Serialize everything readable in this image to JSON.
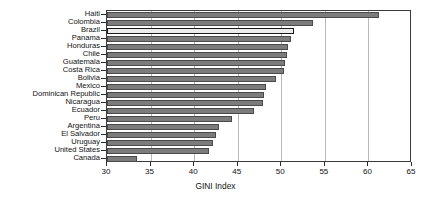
{
  "chart_data": {
    "type": "bar",
    "orientation": "horizontal",
    "title": "",
    "xlabel": "GINI Index",
    "ylabel": "",
    "xlim": [
      30,
      65
    ],
    "xticks": [
      30,
      35,
      40,
      45,
      50,
      55,
      60,
      65
    ],
    "grid": true,
    "grid_axis": "x",
    "legend": "none",
    "highlighted_category": "Brazil",
    "bar_color": "#7c7c7c",
    "highlight_color": "#ececec",
    "categories": [
      "Haiti",
      "Colombia",
      "Brazil",
      "Panama",
      "Honduras",
      "Chile",
      "Guatemala",
      "Costa Rica",
      "Bolivia",
      "Mexico",
      "Dominican Republic",
      "Nicaragua",
      "Ecuador",
      "Peru",
      "Argentina",
      "El Salvador",
      "Uruguay",
      "United States",
      "Canada"
    ],
    "values": [
      61.2,
      53.6,
      51.5,
      51.1,
      50.8,
      50.7,
      50.4,
      50.3,
      49.4,
      48.3,
      48.0,
      47.9,
      46.9,
      44.3,
      42.8,
      42.5,
      42.2,
      41.7,
      33.4
    ]
  }
}
